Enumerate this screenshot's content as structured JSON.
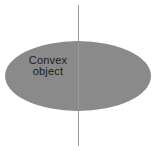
{
  "figure": {
    "background_color": "#ffffff",
    "width": 160,
    "height": 151
  },
  "shape": {
    "kind": "ellipse",
    "label_lines": [
      "Convex",
      "object"
    ],
    "fill_color": "#8a8a8a",
    "center_x": 78,
    "center_y": 76,
    "radius_x": 73,
    "radius_y": 35
  },
  "line": {
    "kind": "vertical-line",
    "color": "#9a9a9a",
    "x": 78.5,
    "y_start": 5,
    "y_end": 146,
    "stroke_width": 1
  }
}
